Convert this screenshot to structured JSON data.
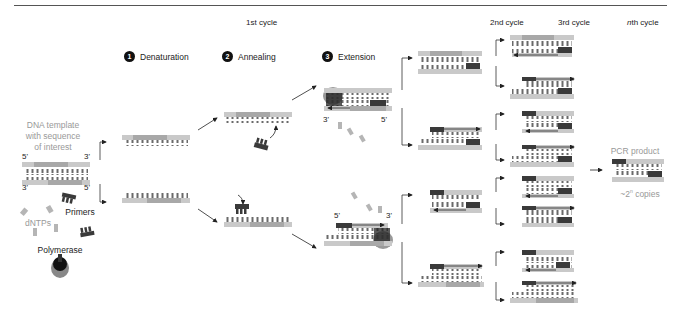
{
  "headers": {
    "cycle1": "1st cycle",
    "cycle2": "2nd cycle",
    "cycle3": "3rd cycle",
    "cycleN_italic": "n",
    "cycleN_rest": "th cycle"
  },
  "steps": [
    {
      "number": "1",
      "label": "Denaturation"
    },
    {
      "number": "2",
      "label": "Annealing"
    },
    {
      "number": "3",
      "label": "Extension"
    }
  ],
  "inputs": {
    "template_label": [
      "DNA template",
      "with sequence",
      "of interest"
    ],
    "top_strand_left": "5'",
    "top_strand_right": "3'",
    "bottom_strand_left": "3'",
    "bottom_strand_right": "5'",
    "dntps": "dNTPs",
    "primers": "Primers",
    "polymerase": "Polymerase"
  },
  "extension_labels": {
    "top_left": "3'",
    "top_right": "5'",
    "bottom_left": "5'",
    "bottom_right": "3'"
  },
  "output": {
    "product_label": "PCR product",
    "copies_prefix": "~2",
    "copies_exp": "n",
    "copies_suffix": " copies"
  },
  "colors": {
    "strand_light": "#c9c9c9",
    "strand_mid": "#a8a8a8",
    "primer_dark": "#3a3a3a",
    "tooth": "#6a6a6a",
    "label_gray": "#999999",
    "text": "#222222"
  }
}
